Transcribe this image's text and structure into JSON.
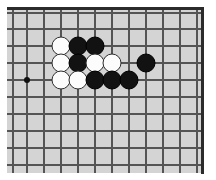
{
  "diagram": {
    "board_color": "#d4d4d4",
    "line_color": "#555555",
    "edge_color": "#2b2b2b",
    "black_color": "#121212",
    "white_color": "#fcfcfc",
    "grid": {
      "columns_x": [
        13,
        27,
        44,
        61,
        78,
        95,
        112,
        129,
        146,
        163,
        180,
        197
      ],
      "rows_y": [
        13,
        29,
        46,
        63,
        80,
        97,
        114,
        131,
        148,
        165
      ],
      "spacing": 17,
      "stone_diameter": 19
    },
    "star_points": [
      {
        "name": "hoshi-upper-left",
        "x": 27,
        "y": 80
      }
    ],
    "stones": [
      {
        "id": "w1",
        "color": "white",
        "x": 61,
        "y": 46
      },
      {
        "id": "b1",
        "color": "black",
        "x": 78,
        "y": 46
      },
      {
        "id": "b2",
        "color": "black",
        "x": 95,
        "y": 46
      },
      {
        "id": "w2",
        "color": "white",
        "x": 61,
        "y": 63
      },
      {
        "id": "b3",
        "color": "black",
        "x": 78,
        "y": 63
      },
      {
        "id": "w3",
        "color": "white",
        "x": 95,
        "y": 63
      },
      {
        "id": "w4",
        "color": "white",
        "x": 112,
        "y": 63
      },
      {
        "id": "b4",
        "color": "black",
        "x": 146,
        "y": 63
      },
      {
        "id": "w5",
        "color": "white",
        "x": 61,
        "y": 80
      },
      {
        "id": "w6",
        "color": "white",
        "x": 78,
        "y": 80
      },
      {
        "id": "b5",
        "color": "black",
        "x": 95,
        "y": 80
      },
      {
        "id": "b6",
        "color": "black",
        "x": 112,
        "y": 80
      },
      {
        "id": "b7",
        "color": "black",
        "x": 129,
        "y": 80
      }
    ],
    "counts": {
      "black_stones": 7,
      "white_stones": 6,
      "total_stones": 13
    }
  }
}
